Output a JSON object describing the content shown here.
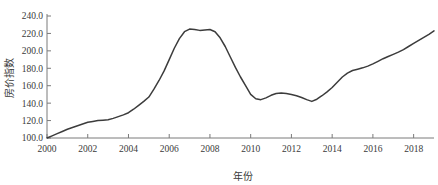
{
  "chart_data": {
    "type": "line",
    "title": "",
    "xlabel": "年份",
    "ylabel": "房价指数",
    "xlim": [
      2000,
      2019
    ],
    "ylim": [
      100,
      240
    ],
    "grid": false,
    "legend": null,
    "x_ticks": [
      "2000",
      "2002",
      "2004",
      "2006",
      "2008",
      "2010",
      "2012",
      "2014",
      "2016",
      "2018"
    ],
    "x_tick_values": [
      2000,
      2002,
      2004,
      2006,
      2008,
      2010,
      2012,
      2014,
      2016,
      2018
    ],
    "y_ticks": [
      "100.0",
      "120.0",
      "140.0",
      "160.0",
      "180.0",
      "200.0",
      "220.0",
      "240.0"
    ],
    "y_tick_values": [
      100,
      120,
      140,
      160,
      180,
      200,
      220,
      240
    ],
    "series": [
      {
        "name": "房价指数",
        "color": "#3c3c3c",
        "x": [
          2000.0,
          2000.25,
          2000.5,
          2000.75,
          2001.0,
          2001.25,
          2001.5,
          2001.75,
          2002.0,
          2002.25,
          2002.5,
          2002.75,
          2003.0,
          2003.25,
          2003.5,
          2003.75,
          2004.0,
          2004.25,
          2004.5,
          2004.75,
          2005.0,
          2005.25,
          2005.5,
          2005.75,
          2006.0,
          2006.25,
          2006.5,
          2006.75,
          2007.0,
          2007.25,
          2007.5,
          2007.75,
          2008.0,
          2008.25,
          2008.5,
          2008.75,
          2009.0,
          2009.25,
          2009.5,
          2009.75,
          2010.0,
          2010.25,
          2010.5,
          2010.75,
          2011.0,
          2011.25,
          2011.5,
          2011.75,
          2012.0,
          2012.25,
          2012.5,
          2012.75,
          2013.0,
          2013.25,
          2013.5,
          2013.75,
          2014.0,
          2014.25,
          2014.5,
          2014.75,
          2015.0,
          2015.25,
          2015.5,
          2015.75,
          2016.0,
          2016.25,
          2016.5,
          2016.75,
          2017.0,
          2017.25,
          2017.5,
          2017.75,
          2018.0,
          2018.25,
          2018.5,
          2018.75,
          2019.0
        ],
        "values": [
          100.0,
          102.5,
          105.0,
          107.5,
          110.0,
          112.0,
          114.0,
          116.0,
          118.0,
          119.0,
          120.0,
          120.5,
          121.0,
          122.5,
          124.5,
          126.5,
          129.0,
          133.0,
          137.5,
          142.0,
          147.0,
          156.0,
          166.0,
          177.0,
          190.0,
          203.0,
          214.0,
          222.0,
          225.0,
          224.5,
          223.5,
          224.0,
          224.5,
          222.0,
          215.0,
          205.0,
          193.0,
          181.0,
          170.0,
          160.0,
          150.0,
          145.0,
          144.0,
          146.0,
          149.0,
          151.0,
          151.5,
          151.0,
          150.0,
          148.5,
          146.5,
          144.0,
          142.0,
          144.5,
          148.5,
          153.0,
          158.0,
          164.0,
          170.0,
          174.5,
          177.5,
          179.0,
          180.5,
          182.5,
          185.0,
          188.0,
          191.0,
          193.5,
          196.0,
          198.5,
          201.5,
          205.0,
          208.5,
          212.0,
          215.5,
          219.0,
          223.0
        ]
      }
    ]
  }
}
